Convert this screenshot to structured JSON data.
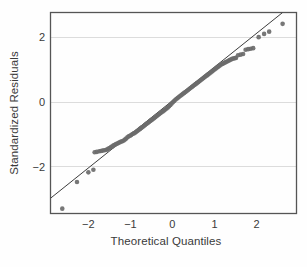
{
  "chart_data": {
    "type": "scatter",
    "title": "",
    "subtitle": "",
    "xlabel": "Theoretical Quantiles",
    "ylabel": "Standardized Residuals",
    "xlim": [
      -2.9,
      2.95
    ],
    "ylim": [
      -3.45,
      2.75
    ],
    "xticks": [
      -2,
      -1,
      0,
      1,
      2
    ],
    "xticklabels": [
      "−2",
      "−1",
      "0",
      "1",
      "2"
    ],
    "yticks": [
      2,
      0,
      -2
    ],
    "yticklabels": [
      "2",
      "0",
      "−2"
    ],
    "grid": "horizontal",
    "legend": "none",
    "annotations": [],
    "colors": {
      "point": "#6b6b6b",
      "reference_line": "#3c3c3c",
      "grid": "#dcdcdc",
      "frame": "#555555",
      "background": "#fefefe",
      "text": "#3a3a3a"
    },
    "point_style": {
      "marker": "circle",
      "radius_px": 2.3,
      "opacity": 0.92
    },
    "reference_line": {
      "label": "normal reference line",
      "x": [
        -2.9,
        2.62
      ],
      "y": [
        -2.98,
        2.75
      ]
    },
    "series": [
      {
        "name": "standardized residuals",
        "x": [
          -2.62,
          -2.27,
          -2.0,
          -1.88,
          -1.85,
          -1.8,
          -1.74,
          -1.7,
          -1.66,
          -1.62,
          -1.58,
          -1.55,
          -1.52,
          -1.49,
          -1.46,
          -1.43,
          -1.4,
          -1.37,
          -1.34,
          -1.31,
          -1.28,
          -1.25,
          -1.22,
          -1.19,
          -1.16,
          -1.13,
          -1.1,
          -1.07,
          -1.04,
          -1.01,
          -0.98,
          -0.95,
          -0.92,
          -0.89,
          -0.86,
          -0.83,
          -0.8,
          -0.77,
          -0.74,
          -0.71,
          -0.68,
          -0.65,
          -0.62,
          -0.59,
          -0.56,
          -0.53,
          -0.5,
          -0.47,
          -0.44,
          -0.41,
          -0.38,
          -0.35,
          -0.32,
          -0.29,
          -0.26,
          -0.23,
          -0.2,
          -0.17,
          -0.14,
          -0.11,
          -0.08,
          -0.05,
          -0.02,
          0.01,
          0.04,
          0.07,
          0.1,
          0.13,
          0.16,
          0.19,
          0.22,
          0.25,
          0.28,
          0.31,
          0.34,
          0.37,
          0.4,
          0.43,
          0.46,
          0.49,
          0.52,
          0.55,
          0.58,
          0.61,
          0.64,
          0.67,
          0.7,
          0.73,
          0.76,
          0.79,
          0.82,
          0.85,
          0.88,
          0.91,
          0.94,
          0.97,
          1.0,
          1.03,
          1.06,
          1.09,
          1.12,
          1.15,
          1.18,
          1.21,
          1.24,
          1.27,
          1.3,
          1.33,
          1.36,
          1.39,
          1.42,
          1.45,
          1.48,
          1.51,
          1.56,
          1.62,
          1.68,
          1.74,
          1.8,
          1.86,
          1.92,
          2.05,
          2.18,
          2.3,
          2.62
        ],
        "y": [
          -3.3,
          -2.48,
          -2.18,
          -2.1,
          -1.56,
          -1.55,
          -1.53,
          -1.52,
          -1.51,
          -1.5,
          -1.49,
          -1.47,
          -1.45,
          -1.43,
          -1.4,
          -1.38,
          -1.35,
          -1.33,
          -1.31,
          -1.29,
          -1.27,
          -1.25,
          -1.23,
          -1.22,
          -1.2,
          -1.17,
          -1.14,
          -1.1,
          -1.07,
          -1.05,
          -1.03,
          -1.0,
          -0.98,
          -0.96,
          -0.93,
          -0.9,
          -0.87,
          -0.84,
          -0.81,
          -0.78,
          -0.75,
          -0.72,
          -0.69,
          -0.66,
          -0.63,
          -0.6,
          -0.57,
          -0.54,
          -0.51,
          -0.48,
          -0.45,
          -0.42,
          -0.39,
          -0.36,
          -0.33,
          -0.3,
          -0.27,
          -0.24,
          -0.21,
          -0.18,
          -0.14,
          -0.1,
          -0.06,
          -0.02,
          0.02,
          0.06,
          0.09,
          0.12,
          0.15,
          0.18,
          0.21,
          0.24,
          0.27,
          0.3,
          0.33,
          0.36,
          0.39,
          0.42,
          0.45,
          0.48,
          0.51,
          0.54,
          0.57,
          0.6,
          0.63,
          0.66,
          0.69,
          0.72,
          0.75,
          0.78,
          0.81,
          0.84,
          0.87,
          0.9,
          0.93,
          0.96,
          0.99,
          1.02,
          1.05,
          1.08,
          1.11,
          1.14,
          1.16,
          1.18,
          1.2,
          1.22,
          1.24,
          1.26,
          1.28,
          1.3,
          1.32,
          1.33,
          1.34,
          1.35,
          1.43,
          1.45,
          1.47,
          1.6,
          1.62,
          1.63,
          1.65,
          1.99,
          2.09,
          2.16,
          2.4
        ]
      }
    ]
  }
}
